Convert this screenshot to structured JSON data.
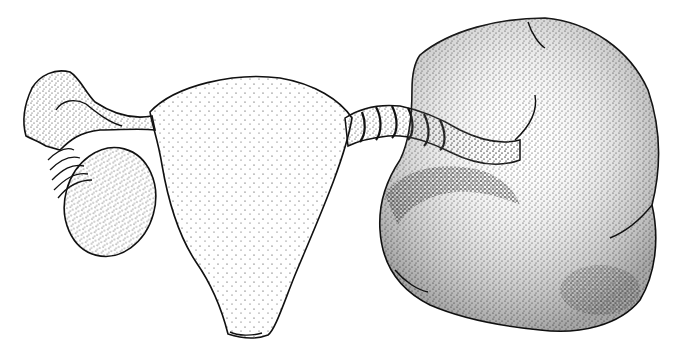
{
  "image": {
    "description": "Stipple medical illustration of a uterus with fallopian tube and ovary on the left, and a greatly enlarged ovarian mass on the right attached by a twisted pedicle (adnexal torsion)",
    "colors": {
      "background": "#ffffff",
      "ink": "#111111"
    },
    "parts": [
      {
        "name": "uterus"
      },
      {
        "name": "left-fallopian-tube"
      },
      {
        "name": "fimbriae"
      },
      {
        "name": "left-ovary"
      },
      {
        "name": "twisted-pedicle"
      },
      {
        "name": "enlarged-ovarian-mass"
      }
    ]
  }
}
